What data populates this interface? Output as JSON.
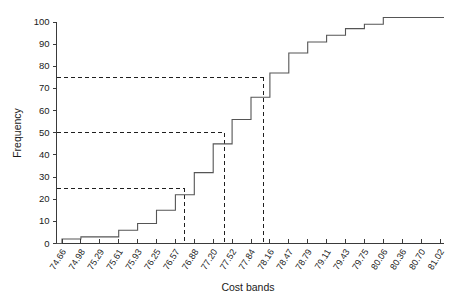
{
  "chart_data": {
    "type": "line",
    "subtype": "cumulative-frequency-ogive",
    "title": "",
    "xlabel": "Cost bands",
    "ylabel": "Frequency",
    "grid": false,
    "legend": false,
    "legend_position": "none",
    "xlim": [
      0,
      20
    ],
    "ylim": [
      0,
      100
    ],
    "yticks": [
      0,
      10,
      20,
      30,
      40,
      50,
      60,
      70,
      80,
      90,
      100
    ],
    "ytick_labels": [
      "0",
      "10",
      "20",
      "30",
      "40",
      "50",
      "60",
      "70",
      "80",
      "90",
      "100"
    ],
    "categories": [
      "74.66",
      "74.98",
      "75.29",
      "75.61",
      "75.93",
      "76.25",
      "76.57",
      "76.88",
      "77.20",
      "77.52",
      "77.84",
      "78.16",
      "78.47",
      "78.79",
      "79.11",
      "79.43",
      "79.75",
      "80.06",
      "80.36",
      "80.70",
      "81.02"
    ],
    "values": [
      2,
      3,
      3,
      6,
      9,
      15,
      22,
      32,
      45,
      56,
      66,
      77,
      86,
      91,
      94,
      97,
      99,
      102,
      102,
      102,
      102
    ],
    "series": [
      {
        "name": "Cumulative frequency",
        "values": [
          2,
          3,
          3,
          6,
          9,
          15,
          22,
          32,
          45,
          56,
          66,
          77,
          86,
          91,
          94,
          97,
          99,
          102,
          102,
          102,
          102
        ],
        "color": "#555555",
        "style": "step"
      }
    ],
    "annotations": {
      "horizontal_reference_lines": [
        {
          "label": "lower-quartile-guide",
          "y": 25
        },
        {
          "label": "median-guide",
          "y": 50
        },
        {
          "label": "upper-quartile-guide",
          "y": 75
        }
      ],
      "vertical_reference_lines": [
        {
          "label": "lower-quartile-drop",
          "x_value": "76.73",
          "x_index": 6.5,
          "from_y": 25,
          "to_y": 0
        },
        {
          "label": "median-drop",
          "x_value": "77.40",
          "x_index": 8.6,
          "from_y": 50,
          "to_y": 0
        },
        {
          "label": "upper-quartile-drop",
          "x_value": "78.05",
          "x_index": 10.65,
          "from_y": 75,
          "to_y": 0
        }
      ],
      "style": "dashed"
    },
    "colors": {
      "curve": "#555555",
      "axis": "#3a3a3a",
      "reference": "#1f1f1f",
      "background": "#ffffff",
      "text": "#1a1a1a"
    }
  },
  "axes": {
    "y_axis_title": "Frequency",
    "x_axis_title": "Cost bands"
  }
}
